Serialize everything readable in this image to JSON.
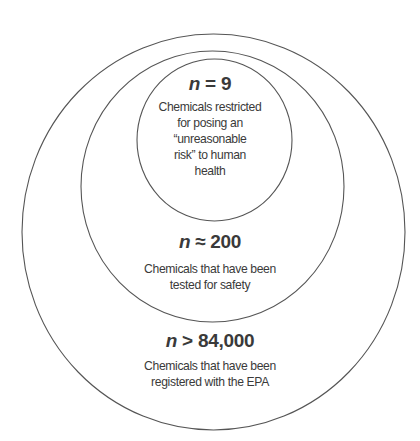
{
  "diagram": {
    "type": "nested-circles",
    "colors": {
      "stroke": "#555555",
      "text": "#3a3a3a",
      "background": "#ffffff"
    },
    "circles": [
      {
        "id": "outer",
        "count_var": "n",
        "count_op": ">",
        "count_value": "84,000",
        "description_lines": [
          "Chemicals that have been",
          "registered with the EPA"
        ]
      },
      {
        "id": "middle",
        "count_var": "n",
        "count_op": "≈",
        "count_value": "200",
        "description_lines": [
          "Chemicals that have been",
          "tested for safety"
        ]
      },
      {
        "id": "inner",
        "count_var": "n",
        "count_op": "=",
        "count_value": "9",
        "description_lines": [
          "Chemicals restricted",
          "for posing an",
          "“unreasonable",
          "risk” to human",
          "health"
        ]
      }
    ]
  }
}
